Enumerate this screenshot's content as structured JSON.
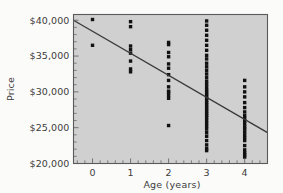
{
  "chart_data": {
    "type": "scatter",
    "title": "",
    "xlabel": "Age (years)",
    "ylabel": "Price",
    "xlim": [
      -0.5,
      4.6
    ],
    "ylim": [
      20000,
      40800
    ],
    "grid": false,
    "legend": null,
    "xticks": [
      0,
      1,
      2,
      3,
      4
    ],
    "xtick_labels": [
      "0",
      "1",
      "2",
      "3",
      "4"
    ],
    "yticks": [
      20000,
      25000,
      30000,
      35000,
      40000
    ],
    "ytick_labels": [
      "$20,000",
      "$25,000",
      "$30,000",
      "$35,000",
      "$40,000"
    ],
    "minor_ticks": true,
    "point_color": "#111111",
    "plot_background": "#d0d0d0",
    "series": [
      {
        "name": "Used car price vs age",
        "x": [
          0,
          0,
          1,
          1,
          1,
          1,
          1,
          1,
          1,
          1,
          2,
          2,
          2,
          2,
          2,
          2,
          2,
          2,
          2,
          2,
          2,
          2,
          2,
          2,
          3,
          3,
          3,
          3,
          3,
          3,
          3,
          3,
          3,
          3,
          3,
          3,
          3,
          3,
          3,
          3,
          3,
          3,
          3,
          3,
          3,
          3,
          3,
          3,
          3,
          3,
          3,
          3,
          3,
          3,
          3,
          3,
          3,
          3,
          3,
          3,
          3,
          3,
          3,
          3,
          3,
          4,
          4,
          4,
          4,
          4,
          4,
          4,
          4,
          4,
          4,
          4,
          4,
          4,
          4,
          4,
          4,
          4,
          4,
          4,
          4,
          4,
          4
        ],
        "y": [
          40100,
          36500,
          39800,
          39100,
          36400,
          35900,
          35400,
          34300,
          33200,
          32800,
          36900,
          36600,
          35500,
          34900,
          33900,
          33300,
          32400,
          31600,
          30700,
          30100,
          29900,
          29500,
          29100,
          25300,
          39900,
          39300,
          38600,
          37900,
          37200,
          36500,
          35800,
          35100,
          34600,
          34000,
          33500,
          33000,
          32500,
          32000,
          31500,
          31100,
          30700,
          30300,
          30000,
          29700,
          29400,
          29100,
          28800,
          28500,
          28200,
          27900,
          27600,
          27300,
          27000,
          26700,
          26400,
          26000,
          25600,
          25200,
          24800,
          24300,
          23800,
          23200,
          22600,
          22100,
          21800,
          31600,
          30700,
          30000,
          29300,
          28500,
          27800,
          27200,
          26700,
          26300,
          25900,
          25500,
          25100,
          24800,
          24400,
          24000,
          23600,
          23200,
          22500,
          21900,
          21500,
          21200,
          20900
        ]
      }
    ],
    "trendline": {
      "type": "linear",
      "x_start": -0.5,
      "y_start": 40000,
      "x_end": 4.6,
      "y_end": 24300,
      "color": "#3a3a3a",
      "description": "Least-squares regression line, negative slope"
    }
  }
}
